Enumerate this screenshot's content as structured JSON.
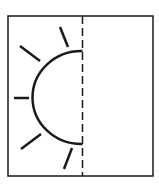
{
  "diagram": {
    "title": "Half sun in folded square",
    "colors": {
      "background": "#ffffff",
      "stroke": "#1a1a1a"
    },
    "frame": {
      "x": 8,
      "y": 16,
      "width": 145,
      "height": 160,
      "stroke_width": 1.5
    },
    "fold_line": {
      "x": 82.5,
      "y1": 16,
      "y2": 176,
      "dash": "8 4",
      "stroke_width": 1.5,
      "style": "dashed"
    },
    "half_sun": {
      "center": [
        82.5,
        97.5
      ],
      "radius": 49,
      "stroke_width": 2.5,
      "side": "left",
      "arc_top_y": 51,
      "arc_bottom_y": 144
    },
    "rays": [
      {
        "name": "top",
        "x1": 60,
        "y1": 27,
        "x2": 68,
        "y2": 47
      },
      {
        "name": "upper-left",
        "x1": 20,
        "y1": 46,
        "x2": 40,
        "y2": 61
      },
      {
        "name": "left",
        "x1": 14,
        "y1": 98,
        "x2": 29,
        "y2": 98
      },
      {
        "name": "lower-left",
        "x1": 21,
        "y1": 149,
        "x2": 41,
        "y2": 134
      },
      {
        "name": "bottom",
        "x1": 64,
        "y1": 169,
        "x2": 72,
        "y2": 148
      }
    ]
  }
}
